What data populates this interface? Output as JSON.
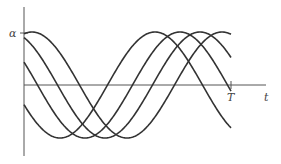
{
  "chart_data": {
    "type": "line",
    "title": "",
    "xlabel": "t",
    "ylabel": "",
    "y_tick_labels": [
      "α"
    ],
    "x_tick_labels": [
      "T"
    ],
    "grid": false,
    "legend": null,
    "amplitude_label": "α",
    "x_range": [
      0,
      1
    ],
    "y_range": [
      -1,
      1
    ],
    "series": [
      {
        "name": "curve-1",
        "function": "α·cos(2π(t - 0.04)/0.92)",
        "phase_crest_t": 0.04
      },
      {
        "name": "curve-2",
        "function": "α·cos(2π(t + 0.07)/0.92)",
        "phase_crest_t": -0.07
      },
      {
        "name": "curve-3",
        "function": "α·cos(2π(t + 0.16)/0.92)",
        "phase_crest_t": -0.16
      },
      {
        "name": "curve-4",
        "function": "α·cos(2π(t + 0.29)/0.92)",
        "phase_crest_t": -0.29
      }
    ]
  },
  "labels": {
    "alpha": "α",
    "T": "T",
    "t": "t"
  },
  "geometry": {
    "origin_x": 24,
    "axis_y": 85,
    "end_x": 231,
    "amplitude_px": 53,
    "period_px": 190,
    "crest_x": [
      32,
      10,
      -10,
      -35
    ]
  }
}
